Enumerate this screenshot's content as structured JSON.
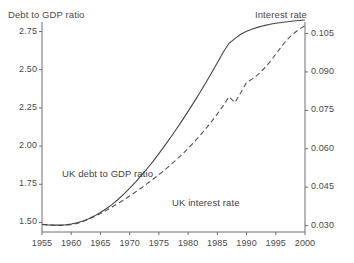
{
  "chart_data": {
    "type": "line",
    "title": "",
    "xlabel": "",
    "ylabel": "Debt to GDP ratio",
    "y2label": "Interest rate",
    "grid": false,
    "legend_position": "inline-annotations",
    "xlim": [
      1955,
      2000
    ],
    "ylim": [
      1.4375,
      2.8125
    ],
    "y2lim": [
      0.0275,
      0.1095
    ],
    "xticks": [
      1955,
      1960,
      1965,
      1970,
      1975,
      1980,
      1985,
      1990,
      1995,
      2000
    ],
    "xtick_labels": [
      "1955",
      "1960",
      "1965",
      "1970",
      "1975",
      "1980",
      "1985",
      "1990",
      "1995",
      "2000"
    ],
    "yticks": [
      1.5,
      1.75,
      2.0,
      2.25,
      2.5,
      2.75
    ],
    "ytick_labels": [
      "1.50",
      "1.75",
      "2.00",
      "2.25",
      "2.50",
      "2.75"
    ],
    "y2ticks": [
      0.03,
      0.045,
      0.06,
      0.075,
      0.09,
      0.105
    ],
    "y2tick_labels": [
      "0.030",
      "0.045",
      "0.060",
      "0.075",
      "0.090",
      "0.105"
    ],
    "x": [
      1955,
      1956,
      1957,
      1958,
      1959,
      1960,
      1961,
      1962,
      1963,
      1964,
      1965,
      1966,
      1967,
      1968,
      1969,
      1970,
      1971,
      1972,
      1973,
      1974,
      1975,
      1976,
      1977,
      1978,
      1979,
      1980,
      1981,
      1982,
      1983,
      1984,
      1985,
      1986,
      1987,
      1988,
      1989,
      1990,
      1991,
      1992,
      1993,
      1994,
      1995,
      1996,
      1997,
      1998,
      1999,
      2000
    ],
    "series": [
      {
        "name": "UK debt to GDP ratio",
        "axis": "left",
        "style": "dashed",
        "color": "#555555",
        "values": [
          1.487,
          1.484,
          1.482,
          1.481,
          1.482,
          1.486,
          1.494,
          1.506,
          1.521,
          1.539,
          1.558,
          1.579,
          1.601,
          1.624,
          1.648,
          1.673,
          1.699,
          1.726,
          1.754,
          1.783,
          1.813,
          1.844,
          1.877,
          1.911,
          1.947,
          1.985,
          2.025,
          2.067,
          2.112,
          2.16,
          2.211,
          2.265,
          2.323,
          2.285,
          2.349,
          2.417,
          2.44,
          2.47,
          2.508,
          2.552,
          2.601,
          2.653,
          2.7,
          2.736,
          2.765,
          2.788
        ]
      },
      {
        "name": "UK interest rate",
        "axis": "right",
        "style": "solid",
        "color": "#444444",
        "values": [
          0.0305,
          0.0303,
          0.0302,
          0.0302,
          0.0303,
          0.0306,
          0.0311,
          0.0318,
          0.0327,
          0.0338,
          0.0351,
          0.0366,
          0.0383,
          0.0402,
          0.0423,
          0.0446,
          0.047,
          0.0496,
          0.0523,
          0.0551,
          0.0581,
          0.0612,
          0.0644,
          0.0677,
          0.0711,
          0.0746,
          0.0782,
          0.0819,
          0.0857,
          0.0896,
          0.0936,
          0.0977,
          0.1012,
          0.103,
          0.1047,
          0.1059,
          0.1068,
          0.1075,
          0.1081,
          0.1086,
          0.109,
          0.1093,
          0.1096,
          0.1099,
          0.1101,
          0.1103
        ]
      }
    ],
    "annotations": [
      {
        "text": "UK debt to GDP ratio"
      },
      {
        "text": "UK interest rate"
      }
    ]
  },
  "axes": {
    "left_title": "Debt to GDP ratio",
    "right_title": "Interest rate"
  }
}
